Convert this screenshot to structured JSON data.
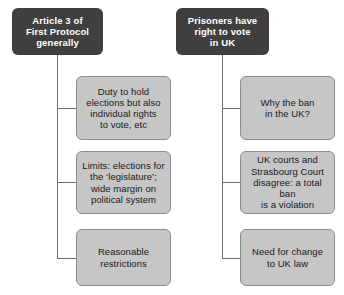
{
  "diagram": {
    "type": "flowchart",
    "colors": {
      "header_fill": "#3f3f3f",
      "header_text": "#ffffff",
      "child_fill": "#c6c6c6",
      "child_border": "#8c8c8c",
      "child_text": "#1a1a1a",
      "connector": "#6e6e6e",
      "background": "#ffffff"
    },
    "columns": [
      {
        "id": "left",
        "header": {
          "text": "Article 3 of\nFirst Protocol\ngenerally",
          "lines": [
            "Article 3 of",
            "First Protocol",
            "generally"
          ]
        },
        "children": [
          {
            "text": "Duty to hold\nelections but also\nindividual rights\nto vote, etc",
            "lines": [
              "Duty to hold",
              "elections but also",
              "individual rights",
              "to vote, etc"
            ]
          },
          {
            "text": "Limits: elections for\nthe ‘legislature’;\nwide margin on\npolitical system",
            "lines": [
              "Limits: elections for",
              "the ‘legislature’;",
              "wide margin on",
              "political system"
            ]
          },
          {
            "text": "Reasonable\nrestrictions",
            "lines": [
              "Reasonable",
              "restrictions"
            ]
          }
        ]
      },
      {
        "id": "right",
        "header": {
          "text": "Prisoners have\nright to vote\nin UK",
          "lines": [
            "Prisoners have",
            "right to vote",
            "in UK"
          ]
        },
        "children": [
          {
            "text": "Why the ban\nin the UK?",
            "lines": [
              "Why the ban",
              "in the UK?"
            ]
          },
          {
            "text": "UK courts and\nStrasbourg Court\ndisagree: a total ban\nis a violation",
            "lines": [
              "UK courts and",
              "Strasbourg Court",
              "disagree: a total ban",
              "is a violation"
            ]
          },
          {
            "text": "Need for change\nto UK law",
            "lines": [
              "Need for change",
              "to UK law"
            ]
          }
        ]
      }
    ]
  }
}
